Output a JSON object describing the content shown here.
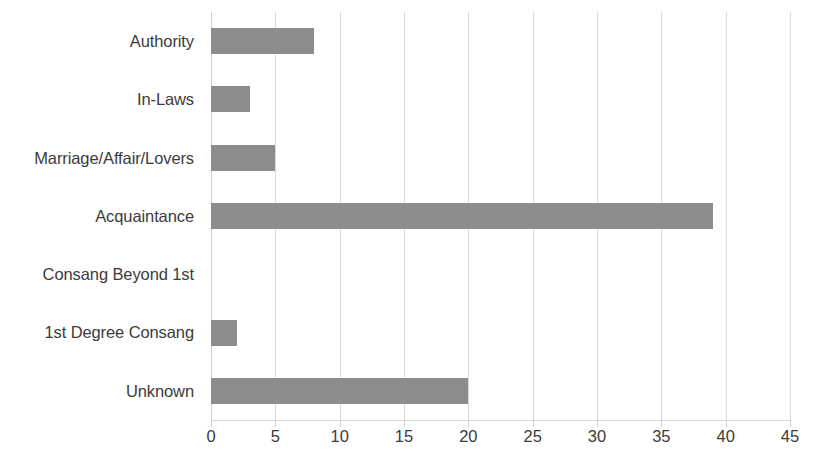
{
  "chart_data": {
    "type": "bar",
    "orientation": "horizontal",
    "title": "",
    "subtitle": "",
    "xlabel": "",
    "ylabel": "",
    "categories": [
      "Authority",
      "In-Laws",
      "Marriage/Affair/Lovers",
      "Acquaintance",
      "Consang Beyond 1st",
      "1st Degree Consang",
      "Unknown"
    ],
    "values": [
      8,
      3,
      5,
      39,
      0,
      2,
      20
    ],
    "series": [
      {
        "name": "Count",
        "values": [
          8,
          3,
          5,
          39,
          0,
          2,
          20
        ]
      }
    ],
    "xlim": [
      0,
      45
    ],
    "x_ticks": [
      0,
      5,
      10,
      15,
      20,
      25,
      30,
      35,
      40,
      45
    ],
    "x_tick_labels": [
      "0",
      "5",
      "10",
      "15",
      "20",
      "25",
      "30",
      "35",
      "40",
      "45"
    ],
    "grid": "vertical",
    "legend": "none",
    "bar_color": "#8c8c8c",
    "gridline_color": "#d9d9d9",
    "text_color": "#3b3b3b",
    "background_color": "#ffffff"
  }
}
